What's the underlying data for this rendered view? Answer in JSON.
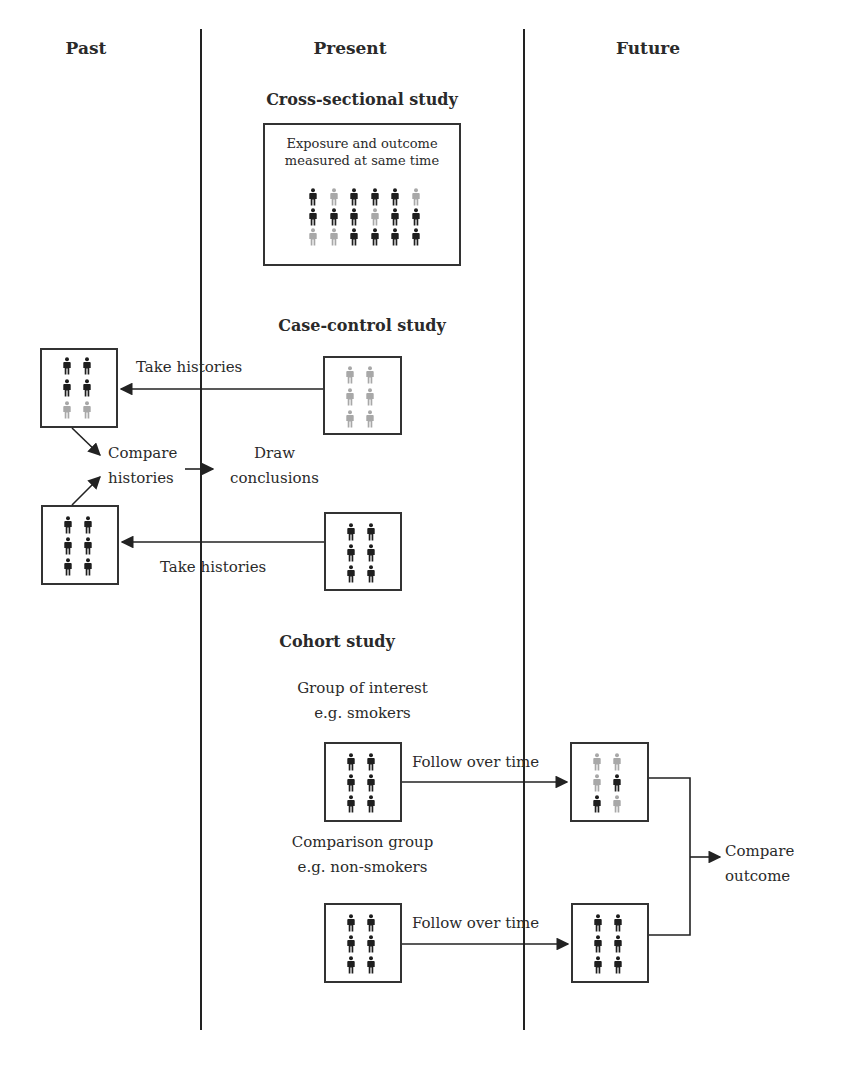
{
  "columns": {
    "past": "Past",
    "present": "Present",
    "future": "Future"
  },
  "cross_sectional": {
    "title": "Cross-sectional study",
    "box_text": "Exposure and outcome measured at same time",
    "grid": [
      [
        "D",
        "L",
        "D",
        "D",
        "D",
        "L"
      ],
      [
        "D",
        "D",
        "D",
        "L",
        "D",
        "D"
      ],
      [
        "L",
        "L",
        "D",
        "D",
        "D",
        "D"
      ]
    ]
  },
  "case_control": {
    "title": "Case-control study",
    "top_arrow_label": "Take histories",
    "bottom_arrow_label": "Take histories",
    "compare_label_line1": "Compare",
    "compare_label_line2": "histories",
    "conclusion_line1": "Draw",
    "conclusion_line2": "conclusions",
    "past_top_grid": [
      [
        "D",
        "D"
      ],
      [
        "D",
        "D"
      ],
      [
        "L",
        "L"
      ]
    ],
    "present_top_grid": [
      [
        "L",
        "L"
      ],
      [
        "L",
        "L"
      ],
      [
        "L",
        "L"
      ]
    ],
    "past_bottom_grid": [
      [
        "D",
        "D"
      ],
      [
        "D",
        "D"
      ],
      [
        "D",
        "D"
      ]
    ],
    "present_bottom_grid": [
      [
        "D",
        "D"
      ],
      [
        "D",
        "D"
      ],
      [
        "D",
        "D"
      ]
    ]
  },
  "cohort": {
    "title": "Cohort study",
    "interest_line1": "Group of interest",
    "interest_line2": "e.g. smokers",
    "comparison_line1": "Comparison group",
    "comparison_line2": "e.g. non-smokers",
    "follow_top": "Follow over time",
    "follow_bottom": "Follow over time",
    "outcome_line1": "Compare",
    "outcome_line2": "outcome",
    "present_top_grid": [
      [
        "D",
        "D"
      ],
      [
        "D",
        "D"
      ],
      [
        "D",
        "D"
      ]
    ],
    "future_top_grid": [
      [
        "L",
        "L"
      ],
      [
        "L",
        "D"
      ],
      [
        "D",
        "L"
      ]
    ],
    "present_bottom_grid": [
      [
        "D",
        "D"
      ],
      [
        "D",
        "D"
      ],
      [
        "D",
        "D"
      ]
    ],
    "future_bottom_grid": [
      [
        "D",
        "D"
      ],
      [
        "D",
        "D"
      ],
      [
        "D",
        "D"
      ]
    ]
  },
  "colors": {
    "dark_person": "#1e1e1e",
    "light_person": "#a8a8a8",
    "line": "#222222"
  }
}
